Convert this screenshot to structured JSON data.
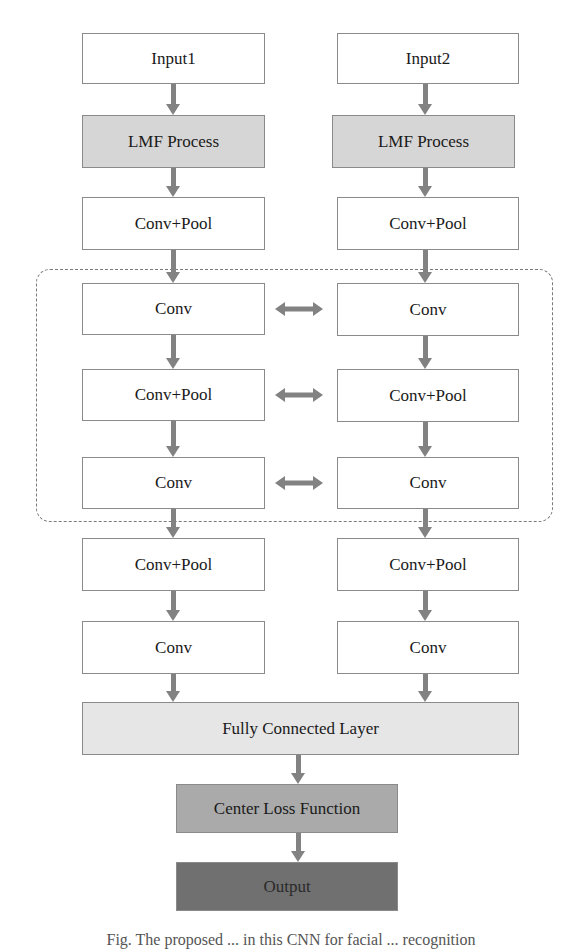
{
  "diagram": {
    "colors": {
      "white_box": "#ffffff",
      "lmf_box": "#d6d6d6",
      "fc_box": "#e6e6e6",
      "center_loss_box": "#aaaaaa",
      "output_box": "#707070",
      "arrow": "#828282",
      "border": "#8a8a8a",
      "dashed_region": "#7a7a7a"
    },
    "left_column": [
      {
        "id": "input1",
        "label": "Input1"
      },
      {
        "id": "lmf1",
        "label": "LMF Process"
      },
      {
        "id": "convpool1a",
        "label": "Conv+Pool"
      },
      {
        "id": "conv1a",
        "label": "Conv"
      },
      {
        "id": "convpool1b",
        "label": "Conv+Pool"
      },
      {
        "id": "conv1b",
        "label": "Conv"
      },
      {
        "id": "convpool1c",
        "label": "Conv+Pool"
      },
      {
        "id": "conv1c",
        "label": "Conv"
      }
    ],
    "right_column": [
      {
        "id": "input2",
        "label": "Input2"
      },
      {
        "id": "lmf2",
        "label": "LMF Process"
      },
      {
        "id": "convpool2a",
        "label": "Conv+Pool"
      },
      {
        "id": "conv2a",
        "label": "Conv"
      },
      {
        "id": "convpool2b",
        "label": "Conv+Pool"
      },
      {
        "id": "conv2b",
        "label": "Conv"
      },
      {
        "id": "convpool2c",
        "label": "Conv+Pool"
      },
      {
        "id": "conv2c",
        "label": "Conv"
      }
    ],
    "shared_region_label": "weight-sharing layers (dashed region)",
    "merge": {
      "fully_connected": "Fully Connected Layer",
      "center_loss": "Center Loss Function",
      "output": "Output"
    },
    "caption": "Fig. The proposed ... in this CNN for facial ... recognition"
  }
}
